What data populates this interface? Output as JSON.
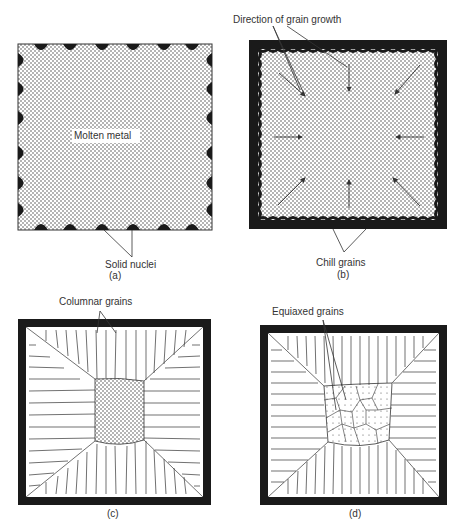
{
  "figure": {
    "panels": [
      {
        "id": "a",
        "caption": "(a)",
        "labels": {
          "center": "Molten metal",
          "bottom": "Solid nuclei"
        }
      },
      {
        "id": "b",
        "caption": "(b)",
        "labels": {
          "top": "Direction of grain growth",
          "bottom": "Chill grains"
        }
      },
      {
        "id": "c",
        "caption": "(c)",
        "labels": {
          "top": "Columnar grains"
        }
      },
      {
        "id": "d",
        "caption": "(d)",
        "labels": {
          "top": "Equiaxed grains"
        }
      }
    ],
    "colors": {
      "ink": "#1a1a1a",
      "stipple": "#555555",
      "background": "#ffffff"
    }
  }
}
